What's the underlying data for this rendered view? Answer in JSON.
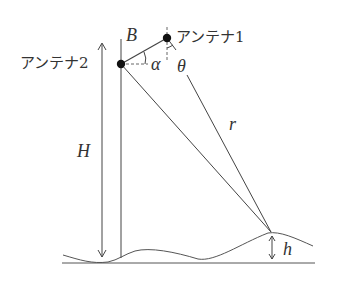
{
  "diagram": {
    "labels": {
      "antenna1": "アンテナ1",
      "antenna2": "アンテナ2",
      "baseline": "B",
      "alpha": "α",
      "theta": "θ",
      "range": "r",
      "height_H": "H",
      "height_h": "h"
    },
    "colors": {
      "line": "#444444",
      "text": "#333333",
      "dot": "#111111"
    },
    "points": {
      "antenna1": [
        167,
        38
      ],
      "antenna2": [
        121,
        64
      ],
      "target": [
        271,
        232
      ]
    }
  }
}
